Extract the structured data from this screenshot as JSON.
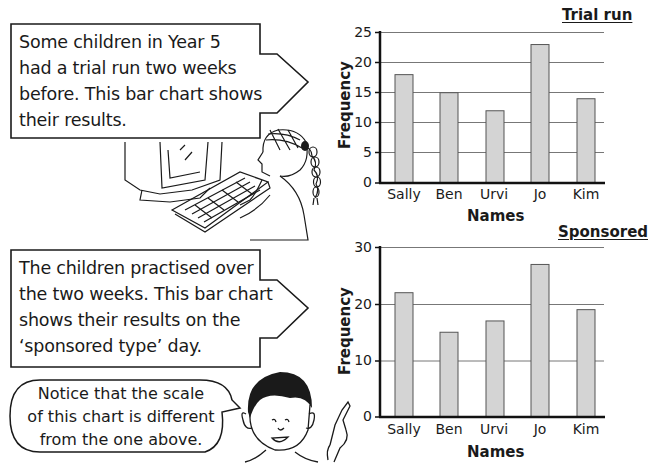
{
  "callouts": [
    {
      "lines": [
        "Some children in Year 5",
        "had a trial run two weeks",
        "before. This bar chart shows",
        "their results."
      ]
    },
    {
      "lines": [
        "The children practised over",
        "the two weeks. This bar chart",
        "shows their results on the",
        "‘sponsored type’ day."
      ]
    }
  ],
  "speech_bubble": {
    "lines": [
      "Notice that the scale",
      "of this chart is different",
      "from the one above."
    ]
  },
  "illustrations": {
    "top": "girl-typing-at-computer",
    "bottom": "boy-pointing"
  },
  "colors": {
    "bar_fill": "#d4d4d4",
    "bar_stroke": "#555555",
    "gridline": "#777777",
    "axis": "#111111",
    "text": "#1a1a1a"
  },
  "chart_data": [
    {
      "type": "bar",
      "title": "Trial run",
      "categories": [
        "Sally",
        "Ben",
        "Urvi",
        "Jo",
        "Kim"
      ],
      "values": [
        18,
        15,
        12,
        23,
        14
      ],
      "xlabel": "Names",
      "ylabel": "Frequency",
      "ylim": [
        0,
        25
      ],
      "yticks": [
        "0",
        "5",
        "10",
        "15",
        "20",
        "25"
      ],
      "grid": true,
      "legend": null
    },
    {
      "type": "bar",
      "title": "Sponsored",
      "categories": [
        "Sally",
        "Ben",
        "Urvi",
        "Jo",
        "Kim"
      ],
      "values": [
        22,
        15,
        17,
        27,
        19
      ],
      "xlabel": "Names",
      "ylabel": "Frequency",
      "ylim": [
        0,
        30
      ],
      "yticks": [
        "0",
        "10",
        "20",
        "30"
      ],
      "grid": true,
      "legend": null
    }
  ]
}
